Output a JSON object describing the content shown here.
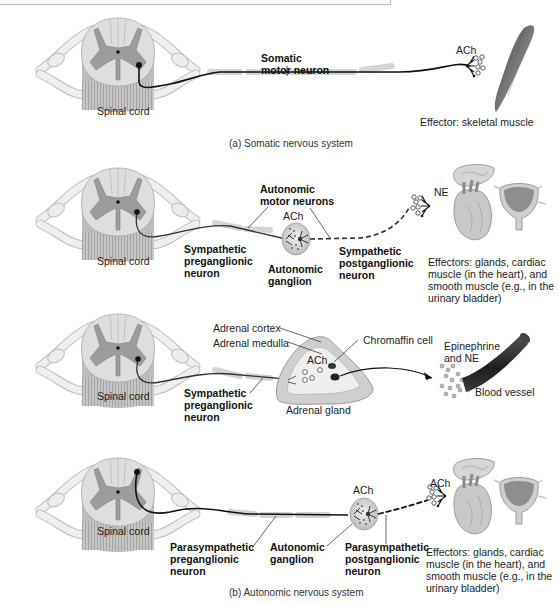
{
  "panels": {
    "somatic": {
      "spinal_cord_label": "Spinal cord",
      "neuron_label_line1": "Somatic",
      "neuron_label_line2": "motor neuron",
      "neurotransmitter": "ACh",
      "effector_label": "Effector: skeletal muscle",
      "caption": "(a) Somatic nervous system"
    },
    "sympathetic": {
      "spinal_cord_label": "Spinal cord",
      "motor_neurons_line1": "Autonomic",
      "motor_neurons_line2": "motor neurons",
      "ganglion_nt": "ACh",
      "preganglionic_line1": "Sympathetic",
      "preganglionic_line2": "preganglionic",
      "preganglionic_line3": "neuron",
      "ganglion_line1": "Autonomic",
      "ganglion_line2": "ganglion",
      "postganglionic_line1": "Sympathetic",
      "postganglionic_line2": "postganglionic",
      "postganglionic_line3": "neuron",
      "effector_nt": "NE",
      "effectors_line1": "Effectors: glands, cardiac",
      "effectors_line2": "muscle (in the heart), and",
      "effectors_line3": "smooth muscle (e.g., in the",
      "effectors_line4": "urinary bladder)"
    },
    "adrenal": {
      "spinal_cord_label": "Spinal cord",
      "adrenal_cortex": "Adrenal cortex",
      "adrenal_medulla": "Adrenal medulla",
      "gland_nt": "ACh",
      "chromaffin_cell": "Chromaffin cell",
      "hormones_line1": "Epinephrine",
      "hormones_line2": "and NE",
      "blood_vessel": "Blood vessel",
      "adrenal_gland": "Adrenal gland",
      "preganglionic_line1": "Sympathetic",
      "preganglionic_line2": "preganglionic",
      "preganglionic_line3": "neuron"
    },
    "parasympathetic": {
      "spinal_cord_label": "Spinal cord",
      "ganglion_nt": "ACh",
      "effector_nt": "ACh",
      "preganglionic_line1": "Parasympathetic",
      "preganglionic_line2": "preganglionic",
      "preganglionic_line3": "neuron",
      "ganglion_line1": "Autonomic",
      "ganglion_line2": "ganglion",
      "postganglionic_line1": "Parasympathetic",
      "postganglionic_line2": "postganglionic",
      "postganglionic_line3": "neuron",
      "effectors_line1": "Effectors: glands, cardiac",
      "effectors_line2": "muscle (in the heart), and",
      "effectors_line3": "smooth muscle (e.g., in the",
      "effectors_line4": "urinary bladder)",
      "caption": "(b) Autonomic nervous system"
    }
  },
  "colors": {
    "white_matter": "#dcdcdc",
    "gray_matter": "#9a9a9a",
    "nerve": "#e9e9e9",
    "axon": "#1a1a1a",
    "myelin": "#d2d2d2",
    "muscle": "#5a5a5a",
    "vessel": "#2b2b2b"
  }
}
